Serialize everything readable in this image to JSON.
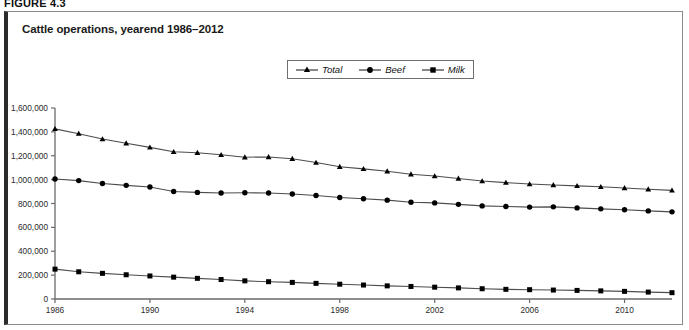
{
  "figure": {
    "label": "FIGURE 4.3",
    "title": "Cattle operations, yearend 1986–2012"
  },
  "legend": {
    "position": "top-center",
    "items": [
      {
        "label": "Total",
        "marker": "triangle-marker"
      },
      {
        "label": "Beef",
        "marker": "circle-marker"
      },
      {
        "label": "Milk",
        "marker": "square-marker"
      }
    ]
  },
  "axes": {
    "y_tick_labels": [
      "1,600,000",
      "1,400,000",
      "1,200,000",
      "1,000,000",
      "800,000",
      "600,000",
      "400,000",
      "200,000",
      "0"
    ],
    "x_tick_labels": [
      "1986",
      "1990",
      "1994",
      "1998",
      "2002",
      "2006",
      "2010"
    ]
  },
  "chart_data": {
    "type": "line",
    "title": "Cattle operations, yearend 1986–2012",
    "xlabel": "",
    "ylabel": "",
    "ylim": [
      0,
      1600000
    ],
    "xlim": [
      1986,
      2012
    ],
    "ytick_step": 200000,
    "xtick_step": 4,
    "grid": false,
    "legend_position": "top-center",
    "x": [
      1986,
      1987,
      1988,
      1989,
      1990,
      1991,
      1992,
      1993,
      1994,
      1995,
      1996,
      1997,
      1998,
      1999,
      2000,
      2001,
      2002,
      2003,
      2004,
      2005,
      2006,
      2007,
      2008,
      2009,
      2010,
      2011,
      2012
    ],
    "series": [
      {
        "name": "Total",
        "marker": "triangle",
        "values": [
          1425000,
          1385000,
          1340000,
          1305000,
          1270000,
          1233000,
          1225000,
          1208000,
          1188000,
          1190000,
          1175000,
          1143000,
          1108000,
          1090000,
          1070000,
          1045000,
          1030000,
          1010000,
          988000,
          975000,
          963000,
          955000,
          948000,
          940000,
          930000,
          920000,
          910000
        ]
      },
      {
        "name": "Beef",
        "marker": "circle",
        "values": [
          1005000,
          992000,
          968000,
          952000,
          938000,
          900000,
          893000,
          888000,
          890000,
          888000,
          880000,
          867000,
          850000,
          840000,
          828000,
          810000,
          805000,
          793000,
          780000,
          775000,
          770000,
          772000,
          763000,
          755000,
          748000,
          738000,
          730000
        ]
      },
      {
        "name": "Milk",
        "marker": "square",
        "values": [
          250000,
          228000,
          215000,
          203000,
          193000,
          183000,
          173000,
          163000,
          152000,
          145000,
          139000,
          131000,
          124000,
          117000,
          110000,
          105000,
          99000,
          93000,
          86000,
          81000,
          78000,
          75000,
          72000,
          68000,
          64000,
          58000,
          53000
        ]
      }
    ]
  }
}
